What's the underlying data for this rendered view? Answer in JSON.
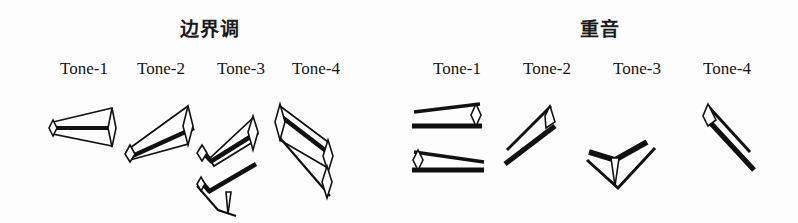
{
  "figure": {
    "background_color": "#fdfdfd",
    "ink_color": "#111111",
    "width": 798,
    "height": 223
  },
  "groups": [
    {
      "id": "boundary-tone",
      "title": "边界调",
      "title_x": 210,
      "title_y": 14,
      "columns": [
        {
          "id": "left-tone-1",
          "label": "Tone-1",
          "label_x": 84,
          "label_y": 59,
          "contour": "level-flat",
          "description": "level tone: horizontal thick baseline with thin open wedge outline, heads at both ends"
        },
        {
          "id": "left-tone-2",
          "label": "Tone-2",
          "label_x": 161,
          "label_y": 59,
          "contour": "rising",
          "description": "rising tone: thick diagonal rising stroke inside thin open wedge, heads at both ends"
        },
        {
          "id": "left-tone-3",
          "label": "Tone-3",
          "label_x": 241,
          "label_y": 59,
          "contour": "dipping-rising",
          "description": "dipping then rising: two stacked bent contours, upper rising with elbow, lower falling-rising with elbow and downward head"
        },
        {
          "id": "left-tone-4",
          "label": "Tone-4",
          "label_x": 316,
          "label_y": 59,
          "contour": "falling",
          "description": "falling tone: long thick diagonal falling stroke inside thin open wedge, heads top-left and bottom-right"
        }
      ]
    },
    {
      "id": "accent",
      "title": "重音",
      "title_x": 600,
      "title_y": 14,
      "columns": [
        {
          "id": "right-tone-1",
          "label": "Tone-1",
          "label_x": 457,
          "label_y": 59,
          "contour": "level-pair",
          "description": "two flat contours: upper narrowing to the right, lower narrowing to the left"
        },
        {
          "id": "right-tone-2",
          "label": "Tone-2",
          "label_x": 547,
          "label_y": 59,
          "contour": "rising",
          "description": "steep rising diagonal wedge with head at upper right"
        },
        {
          "id": "right-tone-3",
          "label": "Tone-3",
          "label_x": 637,
          "label_y": 59,
          "contour": "v-dip",
          "description": "V-shaped dip: falls then rises, downward head at the valley"
        },
        {
          "id": "right-tone-4",
          "label": "Tone-4",
          "label_x": 727,
          "label_y": 59,
          "contour": "falling",
          "description": "steep falling diagonal wedge with head at upper left"
        }
      ]
    }
  ]
}
